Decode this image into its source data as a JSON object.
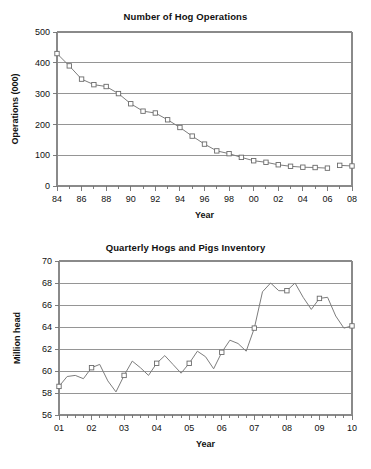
{
  "page": {
    "background_color": "#ffffff",
    "line_color": "#7d7d7d",
    "grid_color": "#8a8a8a",
    "text_color": "#111111",
    "marker_fill": "#ffffff",
    "marker_stroke": "#6b6b6b"
  },
  "chart_data": [
    {
      "id": "hog-operations",
      "type": "line",
      "title": "Number of Hog Operations",
      "xlabel": "Year",
      "ylabel": "Operations (000)",
      "xlim": [
        1984,
        2008
      ],
      "ylim": [
        0,
        500
      ],
      "yticks": [
        0,
        100,
        200,
        300,
        400,
        500
      ],
      "ytick_labels": [
        "0",
        "100",
        "200",
        "300",
        "400",
        "500"
      ],
      "xticks": [
        1984,
        1986,
        1988,
        1990,
        1992,
        1994,
        1996,
        1998,
        2000,
        2002,
        2004,
        2006,
        2008
      ],
      "xtick_labels": [
        "84",
        "86",
        "88",
        "90",
        "92",
        "94",
        "96",
        "98",
        "00",
        "02",
        "04",
        "06",
        "08"
      ],
      "minor_xticks": [
        1985,
        1987,
        1989,
        1991,
        1993,
        1995,
        1997,
        1999,
        2001,
        2003,
        2005,
        2007
      ],
      "grid": "horizontal",
      "markers": "open-square",
      "segments": [
        {
          "x": [
            1984,
            1985,
            1986,
            1987,
            1988,
            1989,
            1990,
            1991,
            1992,
            1993,
            1994,
            1995,
            1996,
            1997,
            1998,
            1999,
            2000,
            2001,
            2002,
            2003,
            2004,
            2005,
            2006
          ],
          "y": [
            430,
            390,
            347,
            329,
            323,
            300,
            267,
            243,
            237,
            215,
            190,
            162,
            136,
            114,
            105,
            93,
            82,
            77,
            69,
            64,
            61,
            60,
            58
          ]
        },
        {
          "x": [
            2007,
            2008
          ],
          "y": [
            67,
            65
          ]
        }
      ]
    },
    {
      "id": "hogs-pigs-inventory",
      "type": "line",
      "title": "Quarterly Hogs and Pigs Inventory",
      "xlabel": "Year",
      "ylabel": "Million head",
      "xlim": [
        2001,
        2010
      ],
      "ylim": [
        56,
        70
      ],
      "yticks": [
        56,
        58,
        60,
        62,
        64,
        66,
        68,
        70
      ],
      "ytick_labels": [
        "56",
        "58",
        "60",
        "62",
        "64",
        "66",
        "68",
        "70"
      ],
      "xticks": [
        2001,
        2002,
        2003,
        2004,
        2005,
        2006,
        2007,
        2008,
        2009,
        2010
      ],
      "xtick_labels": [
        "01",
        "02",
        "03",
        "04",
        "05",
        "06",
        "07",
        "08",
        "09",
        "10"
      ],
      "minor_xticks": [
        2001.25,
        2001.5,
        2001.75,
        2002.25,
        2002.5,
        2002.75,
        2003.25,
        2003.5,
        2003.75,
        2004.25,
        2004.5,
        2004.75,
        2005.25,
        2005.5,
        2005.75,
        2006.25,
        2006.5,
        2006.75,
        2007.25,
        2007.5,
        2007.75,
        2008.25,
        2008.5,
        2008.75,
        2009.25,
        2009.5,
        2009.75
      ],
      "grid": "horizontal",
      "markers": "open-square-annual",
      "segments": [
        {
          "x": [
            2001,
            2001.25,
            2001.5,
            2001.75,
            2002,
            2002.25,
            2002.5,
            2002.75,
            2003,
            2003.25,
            2003.5,
            2003.75,
            2004,
            2004.25,
            2004.5,
            2004.75,
            2005,
            2005.25,
            2005.5,
            2005.75,
            2006,
            2006.25,
            2006.5,
            2006.75,
            2007,
            2007.25,
            2007.5,
            2007.75,
            2008,
            2008.25,
            2008.5,
            2008.75,
            2009,
            2009.25,
            2009.5,
            2009.75,
            2010
          ],
          "y": [
            58.6,
            59.5,
            59.6,
            59.3,
            60.3,
            60.6,
            59.1,
            58.1,
            59.6,
            60.9,
            60.3,
            59.6,
            60.7,
            61.4,
            60.6,
            59.8,
            60.7,
            61.8,
            61.3,
            60.2,
            61.7,
            62.8,
            62.5,
            61.8,
            63.9,
            67.2,
            68.0,
            67.3,
            67.3,
            68.0,
            66.7,
            65.6,
            66.6,
            66.7,
            65.0,
            63.9,
            64.1
          ]
        }
      ],
      "annual_marker_x": [
        2001,
        2002,
        2003,
        2004,
        2005,
        2006,
        2007,
        2008,
        2009,
        2010
      ]
    }
  ]
}
